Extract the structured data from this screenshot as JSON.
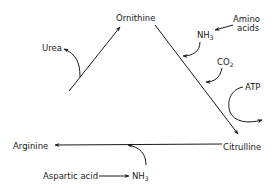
{
  "diagram": {
    "nodes": {
      "ornithine": "Ornithine",
      "citrulline": "Citrulline",
      "arginine": "Arginine"
    },
    "side_labels": {
      "urea": "Urea",
      "amino_acids_line1": "Amino",
      "amino_acids_line2": "acids",
      "nh3_top": "NH",
      "nh3_top_sub": "3",
      "co2": "CO",
      "co2_sub": "2",
      "atp": "ATP",
      "aspartic_acid": "Aspartic acid",
      "nh3_bottom": "NH",
      "nh3_bottom_sub": "3"
    },
    "edges": [
      {
        "from": "Ornithine",
        "to": "Citrulline",
        "inputs": [
          "NH3",
          "CO2"
        ],
        "cofactor": "ATP"
      },
      {
        "from": "Citrulline",
        "to": "Arginine",
        "inputs": [
          "NH3"
        ]
      },
      {
        "from": "Arginine",
        "to": "Ornithine",
        "outputs": [
          "Urea"
        ]
      },
      {
        "from": "Amino acids",
        "to": "NH3"
      },
      {
        "from": "Aspartic acid",
        "to": "NH3"
      }
    ]
  }
}
